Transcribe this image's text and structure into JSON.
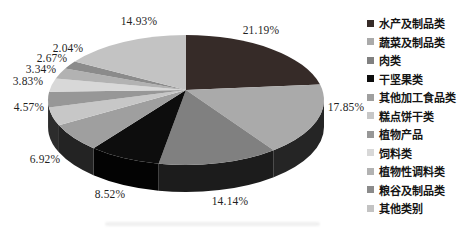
{
  "chart_data": {
    "type": "pie",
    "style": "3d",
    "title": "",
    "start_angle_deg": -90,
    "direction": "clockwise",
    "legend_position": "right",
    "total": 100,
    "series": [
      {
        "name": "水产及制品类",
        "value": 21.19,
        "label": "21.19%",
        "color": "#362b28"
      },
      {
        "name": "蔬菜及制品类",
        "value": 17.85,
        "label": "17.85%",
        "color": "#aaaaaa"
      },
      {
        "name": "肉类",
        "value": 14.14,
        "label": "14.14%",
        "color": "#808080"
      },
      {
        "name": "干坚果类",
        "value": 8.52,
        "label": "8.52%",
        "color": "#0d0d0d"
      },
      {
        "name": "其他加工食品类",
        "value": 6.92,
        "label": "6.92%",
        "color": "#9f9f9f"
      },
      {
        "name": "糕点饼干类",
        "value": 4.57,
        "label": "4.57%",
        "color": "#c7c7c7"
      },
      {
        "name": "植物产品",
        "value": 3.83,
        "label": "3.83%",
        "color": "#979797"
      },
      {
        "name": "饲料类",
        "value": 3.34,
        "label": "3.34%",
        "color": "#d8d8d8"
      },
      {
        "name": "植物性调料类",
        "value": 2.67,
        "label": "2.67%",
        "color": "#b2b2b2"
      },
      {
        "name": "粮谷及制品类",
        "value": 2.04,
        "label": "2.04%",
        "color": "#8b8b8b"
      },
      {
        "name": "其他类别",
        "value": 14.93,
        "label": "14.93%",
        "color": "#c3c3c3"
      }
    ]
  }
}
